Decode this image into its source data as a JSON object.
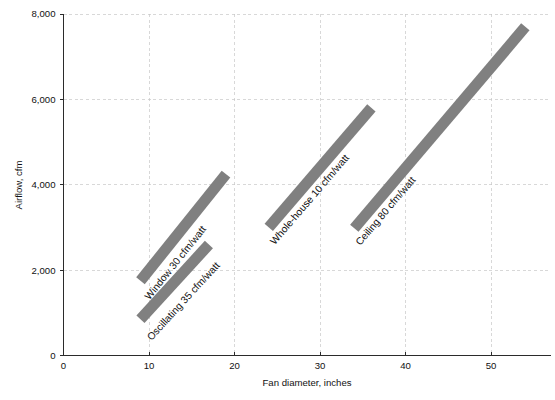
{
  "chart_data": {
    "type": "line",
    "title": "",
    "xlabel": "Fan diameter, inches",
    "ylabel": "Airflow, cfm",
    "xlim": [
      0,
      57
    ],
    "ylim": [
      0,
      8000
    ],
    "grid": true,
    "legend_position": "inline-labels",
    "xticks": [
      {
        "value": 0,
        "label": "0"
      },
      {
        "value": 10,
        "label": "10"
      },
      {
        "value": 20,
        "label": "20"
      },
      {
        "value": 30,
        "label": "30"
      },
      {
        "value": 40,
        "label": "40"
      },
      {
        "value": 50,
        "label": "50"
      }
    ],
    "yticks": [
      {
        "value": 0,
        "label": "0"
      },
      {
        "value": 2000,
        "label": "2,000"
      },
      {
        "value": 4000,
        "label": "4,000"
      },
      {
        "value": 6000,
        "label": "6,000"
      },
      {
        "value": 8000,
        "label": "8,000"
      }
    ],
    "series": [
      {
        "name": "Oscillating 35 cfm/watt",
        "label": "Oscillating 35 cfm/watt",
        "efficacy_cfm_per_watt": 35,
        "color": "#808080",
        "x": [
          9,
          17
        ],
        "values": [
          850,
          2600
        ],
        "label_offset": {
          "dx": 9,
          "dy": 20
        }
      },
      {
        "name": "Window 30 cfm/watt",
        "label": "Window 30 cfm/watt",
        "efficacy_cfm_per_watt": 30,
        "color": "#808080",
        "x": [
          9,
          19
        ],
        "values": [
          1750,
          4250
        ],
        "label_offset": {
          "dx": 7,
          "dy": 18
        }
      },
      {
        "name": "Whole-house 10 cfm/watt",
        "label": "Whole-house 10 cfm/watt",
        "efficacy_cfm_per_watt": 10,
        "color": "#808080",
        "x": [
          24,
          36
        ],
        "values": [
          3000,
          5800
        ],
        "label_offset": {
          "dx": 4,
          "dy": 16
        }
      },
      {
        "name": "Ceiling 80 cfm/watt",
        "label": "Ceiling 80 cfm/watt",
        "efficacy_cfm_per_watt": 80,
        "color": "#808080",
        "x": [
          34,
          54
        ],
        "values": [
          2980,
          7700
        ],
        "label_offset": {
          "dx": 4,
          "dy": 16
        }
      }
    ]
  },
  "figure": {
    "background_color": "#ffffff",
    "axis_color": "#2b2b2b",
    "grid_color": "#c8c8c8",
    "bar_color": "#808080",
    "bar_thickness_px": 11
  }
}
